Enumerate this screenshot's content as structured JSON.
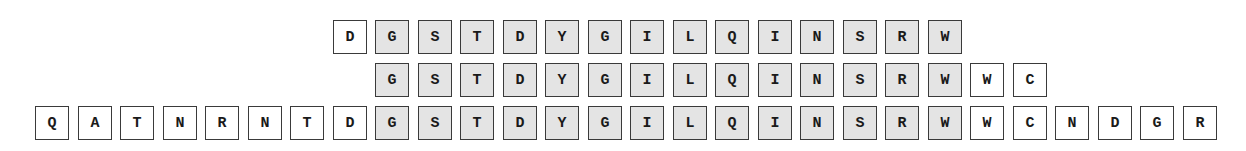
{
  "diagram": {
    "title": "",
    "colors": {
      "shaded": "#e4e4e4",
      "plain": "#ffffff",
      "border": "#3a3a3a"
    },
    "rows": [
      {
        "name": "row-1",
        "start_index": 7,
        "cells": [
          {
            "letter": "D",
            "shaded": false
          },
          {
            "letter": "G",
            "shaded": true
          },
          {
            "letter": "S",
            "shaded": true
          },
          {
            "letter": "T",
            "shaded": true
          },
          {
            "letter": "D",
            "shaded": true
          },
          {
            "letter": "Y",
            "shaded": true
          },
          {
            "letter": "G",
            "shaded": true
          },
          {
            "letter": "I",
            "shaded": true
          },
          {
            "letter": "L",
            "shaded": true
          },
          {
            "letter": "Q",
            "shaded": true
          },
          {
            "letter": "I",
            "shaded": true
          },
          {
            "letter": "N",
            "shaded": true
          },
          {
            "letter": "S",
            "shaded": true
          },
          {
            "letter": "R",
            "shaded": true
          },
          {
            "letter": "W",
            "shaded": true
          }
        ]
      },
      {
        "name": "row-2",
        "start_index": 8,
        "cells": [
          {
            "letter": "G",
            "shaded": true
          },
          {
            "letter": "S",
            "shaded": true
          },
          {
            "letter": "T",
            "shaded": true
          },
          {
            "letter": "D",
            "shaded": true
          },
          {
            "letter": "Y",
            "shaded": true
          },
          {
            "letter": "G",
            "shaded": true
          },
          {
            "letter": "I",
            "shaded": true
          },
          {
            "letter": "L",
            "shaded": true
          },
          {
            "letter": "Q",
            "shaded": true
          },
          {
            "letter": "I",
            "shaded": true
          },
          {
            "letter": "N",
            "shaded": true
          },
          {
            "letter": "S",
            "shaded": true
          },
          {
            "letter": "R",
            "shaded": true
          },
          {
            "letter": "W",
            "shaded": true
          },
          {
            "letter": "W",
            "shaded": false
          },
          {
            "letter": "C",
            "shaded": false
          }
        ]
      },
      {
        "name": "row-3",
        "start_index": 0,
        "cells": [
          {
            "letter": "Q",
            "shaded": false
          },
          {
            "letter": "A",
            "shaded": false
          },
          {
            "letter": "T",
            "shaded": false
          },
          {
            "letter": "N",
            "shaded": false
          },
          {
            "letter": "R",
            "shaded": false
          },
          {
            "letter": "N",
            "shaded": false
          },
          {
            "letter": "T",
            "shaded": false
          },
          {
            "letter": "D",
            "shaded": false
          },
          {
            "letter": "G",
            "shaded": true
          },
          {
            "letter": "S",
            "shaded": true
          },
          {
            "letter": "T",
            "shaded": true
          },
          {
            "letter": "D",
            "shaded": true
          },
          {
            "letter": "Y",
            "shaded": true
          },
          {
            "letter": "G",
            "shaded": true
          },
          {
            "letter": "I",
            "shaded": true
          },
          {
            "letter": "L",
            "shaded": true
          },
          {
            "letter": "Q",
            "shaded": true
          },
          {
            "letter": "I",
            "shaded": true
          },
          {
            "letter": "N",
            "shaded": true
          },
          {
            "letter": "S",
            "shaded": true
          },
          {
            "letter": "R",
            "shaded": true
          },
          {
            "letter": "W",
            "shaded": true
          },
          {
            "letter": "W",
            "shaded": false
          },
          {
            "letter": "C",
            "shaded": false
          },
          {
            "letter": "N",
            "shaded": false
          },
          {
            "letter": "D",
            "shaded": false
          },
          {
            "letter": "G",
            "shaded": false
          },
          {
            "letter": "R",
            "shaded": false
          }
        ]
      }
    ]
  }
}
